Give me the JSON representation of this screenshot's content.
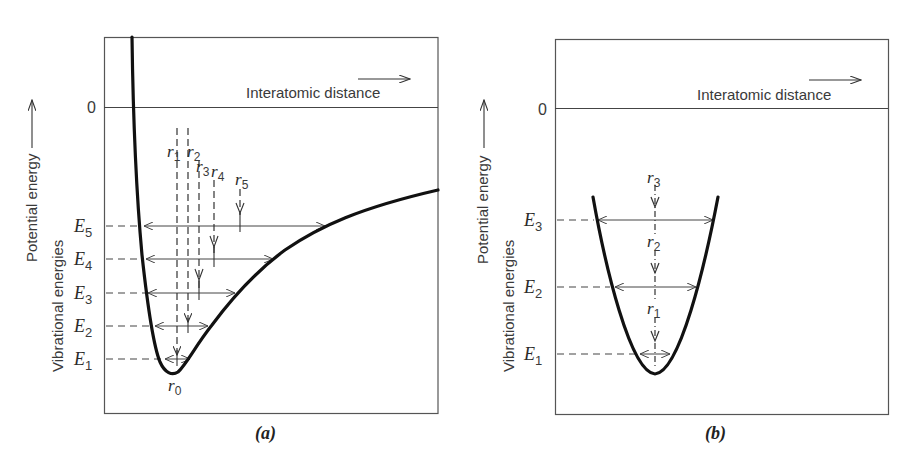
{
  "figure": {
    "panels": [
      {
        "id": "a",
        "caption": "(a)",
        "y_axis_label_outer": "Potential energy",
        "y_axis_label_inner": "Vibrational energies",
        "x_axis_label": "Interatomic distance",
        "zero_label": "0",
        "curve_type": "anharmonic (Morse-like) potential well",
        "energy_levels": [
          {
            "label": "E",
            "sub": "1"
          },
          {
            "label": "E",
            "sub": "2"
          },
          {
            "label": "E",
            "sub": "3"
          },
          {
            "label": "E",
            "sub": "4"
          },
          {
            "label": "E",
            "sub": "5"
          }
        ],
        "mean_positions": [
          {
            "label": "r",
            "sub": "0"
          },
          {
            "label": "r",
            "sub": "1"
          },
          {
            "label": "r",
            "sub": "2"
          },
          {
            "label": "r",
            "sub": "3"
          },
          {
            "label": "r",
            "sub": "4"
          },
          {
            "label": "r",
            "sub": "5"
          }
        ]
      },
      {
        "id": "b",
        "caption": "(b)",
        "y_axis_label_outer": "Potential energy",
        "y_axis_label_inner": "Vibrational energies",
        "x_axis_label": "Interatomic distance",
        "zero_label": "0",
        "curve_type": "harmonic (parabolic) potential well",
        "energy_levels": [
          {
            "label": "E",
            "sub": "1"
          },
          {
            "label": "E",
            "sub": "2"
          },
          {
            "label": "E",
            "sub": "3"
          }
        ],
        "mean_positions": [
          {
            "label": "r",
            "sub": "1"
          },
          {
            "label": "r",
            "sub": "2"
          },
          {
            "label": "r",
            "sub": "3"
          }
        ]
      }
    ]
  },
  "colors": {
    "curve": "#111111",
    "frame": "#555555",
    "guide": "#444444",
    "text": "#3a3a3a"
  }
}
